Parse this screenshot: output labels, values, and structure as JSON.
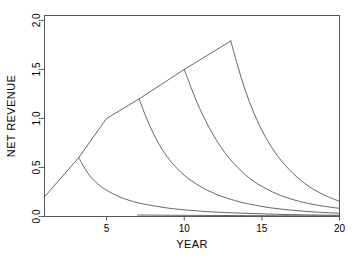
{
  "chart_data": {
    "type": "line",
    "title": "",
    "xlabel": "YEAR",
    "ylabel": "NET REVENUE",
    "xlim": [
      1,
      20
    ],
    "ylim": [
      0.0,
      2.05
    ],
    "xticks": [
      5,
      10,
      15,
      20
    ],
    "xtick_labels": [
      "5",
      "10",
      "15",
      "20"
    ],
    "yticks": [
      0.0,
      0.5,
      1.0,
      1.5,
      2.0
    ],
    "ytick_labels": [
      "0.0",
      "0.5",
      "1.0",
      "1.5",
      "2.0"
    ],
    "grid": false,
    "legend": null,
    "series": [
      {
        "name": "envelope",
        "x": [
          1.0,
          3.2,
          5.0,
          7.1,
          10.0,
          13.0
        ],
        "values": [
          0.2,
          0.6,
          1.0,
          1.2,
          1.5,
          1.79
        ]
      },
      {
        "name": "decay-1",
        "x": [
          3.2,
          3.6,
          4.0,
          4.6,
          5.2,
          6.0,
          7.0,
          8.0,
          9.0,
          10.0,
          11.5,
          13.0,
          15.0,
          17.0,
          20.0
        ],
        "values": [
          0.6,
          0.49,
          0.4,
          0.31,
          0.25,
          0.19,
          0.14,
          0.11,
          0.085,
          0.068,
          0.05,
          0.038,
          0.027,
          0.019,
          0.012
        ]
      },
      {
        "name": "decay-2",
        "x": [
          7.1,
          7.5,
          8.0,
          8.6,
          9.2,
          10.0,
          11.0,
          12.0,
          13.0,
          14.0,
          15.5,
          17.0,
          18.5,
          20.0
        ],
        "values": [
          1.2,
          1.03,
          0.85,
          0.68,
          0.55,
          0.42,
          0.31,
          0.23,
          0.175,
          0.133,
          0.09,
          0.063,
          0.045,
          0.033
        ]
      },
      {
        "name": "decay-3",
        "x": [
          10.0,
          10.5,
          11.0,
          11.7,
          12.4,
          13.2,
          14.2,
          15.2,
          16.2,
          17.4,
          18.6,
          20.0
        ],
        "values": [
          1.5,
          1.29,
          1.1,
          0.88,
          0.7,
          0.54,
          0.39,
          0.29,
          0.215,
          0.155,
          0.115,
          0.083
        ]
      },
      {
        "name": "decay-4",
        "x": [
          13.0,
          13.4,
          13.9,
          14.5,
          15.2,
          16.0,
          17.0,
          18.0,
          19.0,
          20.0
        ],
        "values": [
          1.79,
          1.56,
          1.3,
          1.05,
          0.82,
          0.62,
          0.44,
          0.31,
          0.22,
          0.155
        ]
      },
      {
        "name": "baseline",
        "x": [
          7.0,
          10.0,
          13.0,
          16.0,
          20.0
        ],
        "values": [
          0.015,
          0.012,
          0.01,
          0.008,
          0.006
        ]
      }
    ]
  }
}
